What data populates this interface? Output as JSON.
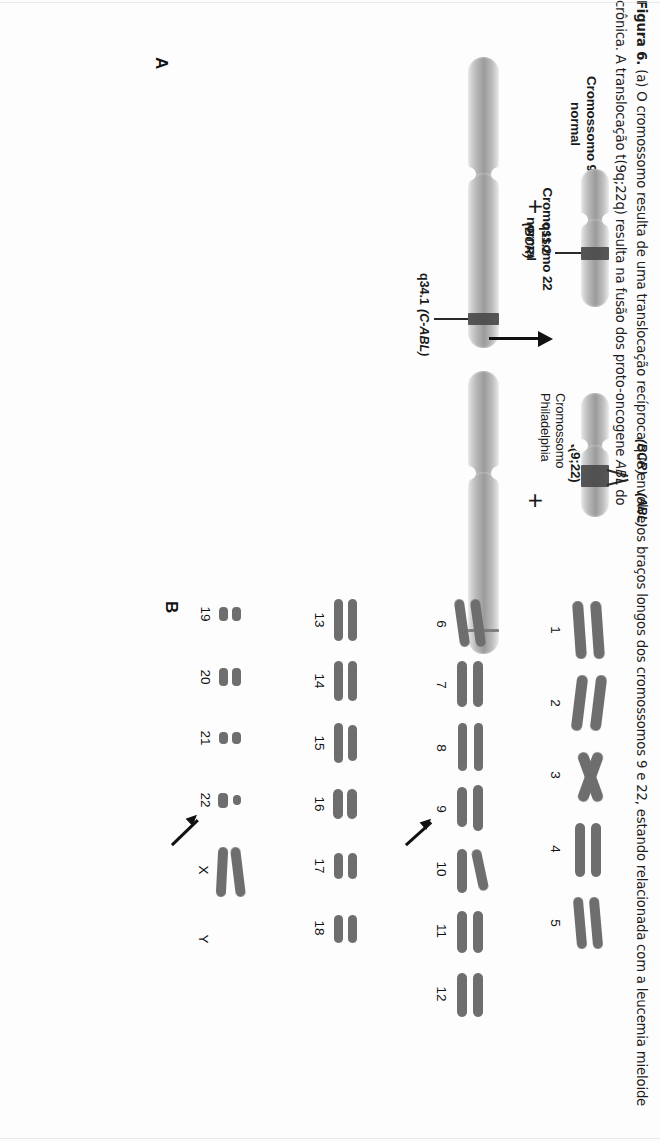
{
  "figure": {
    "panel_a_letter": "A",
    "panel_b_letter": "B",
    "headings": {
      "chr9_normal": "Cromossomo 9\nnormal",
      "chr22_normal": "Cromossomo 22\nnormal",
      "translocation": "Translocação\nt(9;22)"
    },
    "labels": {
      "plus_left": "+",
      "plus_right": "+",
      "q34_1": "q34.1 (C-ABL)",
      "q34_1_band": "q34.1",
      "q34_1_gene": "(C-ABL)",
      "q11_2_band": "q11.2",
      "q11_2_gene": "(BCR)",
      "bcr": "(BCR)",
      "abl": "(ABL)",
      "philadelphia": "Cromossomo\nPhiladelphia"
    }
  },
  "karyotype": {
    "rows": [
      {
        "numbers": [
          "1",
          "2",
          "3",
          "4",
          "5"
        ]
      },
      {
        "numbers": [
          "6",
          "7",
          "8",
          "9",
          "10",
          "11",
          "12"
        ]
      },
      {
        "numbers": [
          "13",
          "14",
          "15",
          "16",
          "17",
          "18"
        ]
      },
      {
        "numbers": [
          "19",
          "20",
          "21",
          "22",
          "X",
          "Y"
        ]
      }
    ],
    "arrow_targets": [
      "9",
      "22"
    ]
  },
  "caption": {
    "figure_number": "Figura 6.",
    "text": " (a) O cromossomo resulta de uma translocação recíproca que envolve os braços longos dos cromossomos 9 e 22, estando relacionada com a leucemia mieloide crônica. A translocação t(9q;22q) resulta na fusão dos proto-oncogene ",
    "italic_gene": "ABL",
    "text_end": " do"
  },
  "colors": {
    "ink": "#1a1a1a",
    "band": "#4a4a4a",
    "chromosome_grey": "#9b9b9b",
    "paper": "#fdfdfd"
  }
}
